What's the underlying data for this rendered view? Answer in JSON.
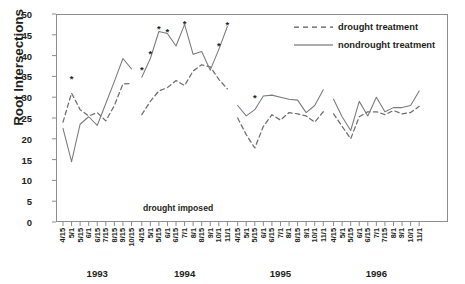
{
  "chart_data": {
    "type": "line",
    "title": "",
    "xlabel": "",
    "ylabel": "Root Intersections",
    "ylim": [
      0,
      50
    ],
    "yticks": [
      0,
      5,
      10,
      15,
      20,
      25,
      30,
      35,
      40,
      45,
      50
    ],
    "grid": false,
    "legend_position": "top-right",
    "annotation": "drought imposed",
    "year_groups": [
      {
        "year": "1993",
        "tick_labels": [
          "4/15",
          "5/1",
          "5/15",
          "6/1",
          "6/15",
          "7/15",
          "8/15",
          "9/15",
          "10/15"
        ],
        "series": [
          {
            "name": "drought treatment",
            "values": [
              24.0,
              31.0,
              27.0,
              25.5,
              26.3,
              24.3,
              28.0,
              33.2,
              33.3
            ]
          },
          {
            "name": "nondrought treatment",
            "values": [
              22.5,
              14.5,
              23.5,
              25.3,
              23.2,
              28.5,
              33.8,
              39.3,
              36.8
            ]
          }
        ],
        "significance_markers": [
          {
            "x_index": 1,
            "y": 34.3
          }
        ]
      },
      {
        "year": "1994",
        "tick_labels": [
          "4/15",
          "5/1",
          "5/15",
          "6/1",
          "6/15",
          "7/1",
          "8/1",
          "8/15",
          "9/1",
          "10/1",
          "11/1"
        ],
        "series": [
          {
            "name": "drought treatment",
            "values": [
              25.8,
              29.0,
              31.5,
              32.3,
              34.0,
              32.8,
              36.3,
              37.8,
              37.3,
              34.3,
              32.0
            ]
          },
          {
            "name": "nondrought treatment",
            "values": [
              34.8,
              39.3,
              45.8,
              45.3,
              42.3,
              47.5,
              40.3,
              41.0,
              36.5,
              41.5,
              47.0
            ]
          }
        ],
        "significance_markers": [
          {
            "x_index": 0,
            "y": 36.5
          },
          {
            "x_index": 1,
            "y": 40.2
          },
          {
            "x_index": 2,
            "y": 46.2
          },
          {
            "x_index": 3,
            "y": 45.5
          },
          {
            "x_index": 5,
            "y": 47.6
          },
          {
            "x_index": 9,
            "y": 42.2
          },
          {
            "x_index": 10,
            "y": 47.3
          }
        ]
      },
      {
        "year": "1995",
        "tick_labels": [
          "4/15",
          "5/1",
          "5/15",
          "6/1",
          "6/15",
          "7/1",
          "8/1",
          "8/15",
          "9/1",
          "10/1",
          "11/1"
        ],
        "series": [
          {
            "name": "drought treatment",
            "values": [
              25.0,
              21.0,
              17.8,
              23.0,
              25.8,
              24.5,
              26.3,
              26.0,
              25.5,
              24.0,
              26.5
            ]
          },
          {
            "name": "nondrought treatment",
            "values": [
              28.0,
              25.5,
              27.0,
              30.3,
              30.5,
              30.0,
              29.5,
              29.3,
              26.3,
              28.0,
              31.8
            ]
          }
        ],
        "significance_markers": [
          {
            "x_index": 2,
            "y": 29.6
          }
        ]
      },
      {
        "year": "1996",
        "tick_labels": [
          "4/15",
          "5/1",
          "5/15",
          "6/1",
          "6/15",
          "7/1",
          "7/15",
          "8/1",
          "9/1",
          "10/1",
          "11/1"
        ],
        "series": [
          {
            "name": "drought treatment",
            "values": [
              26.0,
              23.0,
              20.0,
              25.3,
              26.5,
              26.5,
              25.8,
              26.8,
              26.0,
              26.3,
              27.8
            ]
          },
          {
            "name": "nondrought treatment",
            "values": [
              29.5,
              25.3,
              22.0,
              29.0,
              25.5,
              30.0,
              26.5,
              27.5,
              27.5,
              28.0,
              31.5
            ]
          }
        ],
        "significance_markers": []
      }
    ]
  },
  "axis": {
    "ylabel": "Root Intersections",
    "ytick_labels": [
      "50",
      "45",
      "40",
      "35",
      "30",
      "25",
      "20",
      "15",
      "10",
      "5",
      "0"
    ]
  },
  "legend": {
    "entries": [
      {
        "label": "drought treatment",
        "style": "dashed",
        "color": "#5a5a5a"
      },
      {
        "label": "nondrought treatment",
        "style": "solid",
        "color": "#5a5a5a"
      }
    ]
  },
  "annotations": {
    "drought_imposed": "drought imposed"
  }
}
